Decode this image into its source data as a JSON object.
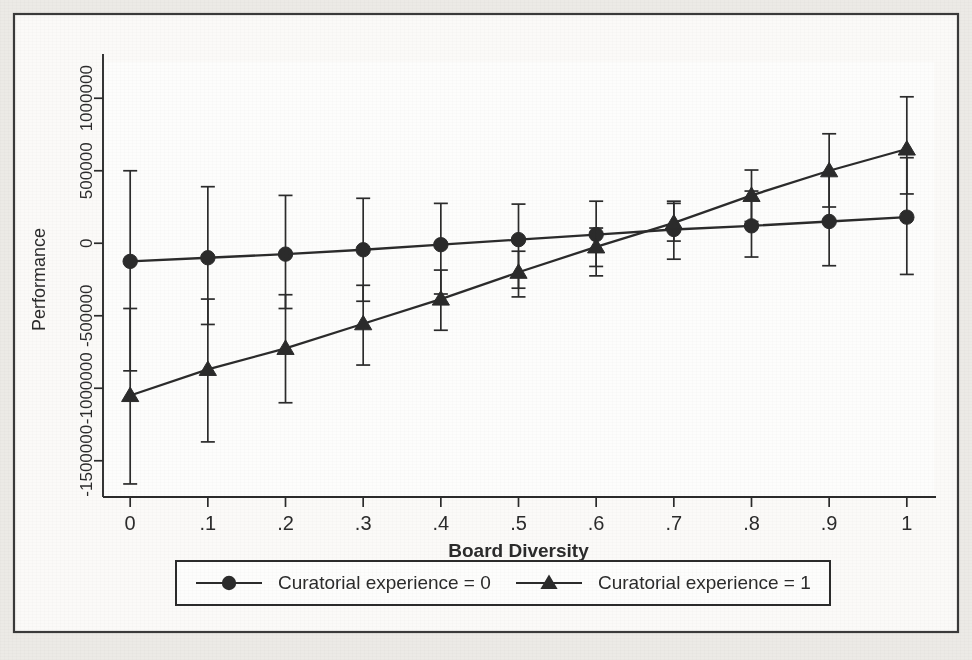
{
  "figure": {
    "background_color": "#eceae6",
    "plot_background_color": "#fdfdfc",
    "ink_color": "#2b2b2b",
    "border_color": "#3a3a3a"
  },
  "chart_data": {
    "type": "line",
    "title": "",
    "subtitle": "",
    "xlabel": "Board Diversity",
    "ylabel": "Performance",
    "x": [
      0,
      0.1,
      0.2,
      0.3,
      0.4,
      0.5,
      0.6,
      0.7,
      0.8,
      0.9,
      1
    ],
    "xtick_labels": [
      "0",
      ".1",
      ".2",
      ".3",
      ".4",
      ".5",
      ".6",
      ".7",
      ".8",
      ".9",
      "1"
    ],
    "ytick_values": [
      1000000,
      500000,
      0,
      -500000,
      -1000000,
      -1500000
    ],
    "ytick_labels": [
      "1000000",
      "500000",
      "0",
      "-500000",
      "-1000000",
      "-1500000"
    ],
    "xlim": [
      -0.035,
      1.035
    ],
    "ylim": [
      -1750000,
      1250000
    ],
    "grid": false,
    "legend_position": "below-axes",
    "legend_box": true,
    "series": [
      {
        "name": "Curatorial experience = 0",
        "marker": "circle",
        "values": [
          -125000,
          -100000,
          -75000,
          -45000,
          -10000,
          25000,
          60000,
          95000,
          120000,
          150000,
          180000
        ],
        "ci_low": [
          -880000,
          -560000,
          -450000,
          -400000,
          -350000,
          -310000,
          -225000,
          -110000,
          -95000,
          -155000,
          -215000
        ],
        "ci_high": [
          500000,
          390000,
          330000,
          310000,
          275000,
          270000,
          290000,
          290000,
          360000,
          470000,
          590000
        ]
      },
      {
        "name": "Curatorial experience = 1",
        "marker": "triangle",
        "values": [
          -1050000,
          -870000,
          -725000,
          -555000,
          -385000,
          -200000,
          -25000,
          140000,
          330000,
          500000,
          650000
        ],
        "ci_low": [
          -1660000,
          -1370000,
          -1100000,
          -840000,
          -600000,
          -370000,
          -160000,
          15000,
          150000,
          250000,
          340000
        ],
        "ci_high": [
          -450000,
          -385000,
          -355000,
          -290000,
          -185000,
          -55000,
          105000,
          275000,
          505000,
          755000,
          1010000
        ]
      }
    ]
  },
  "legend": {
    "items": [
      {
        "label": "Curatorial experience = 0",
        "marker": "circle"
      },
      {
        "label": "Curatorial experience = 1",
        "marker": "triangle"
      }
    ]
  },
  "axis_labels": {
    "x": "Board Diversity",
    "y": "Performance"
  }
}
